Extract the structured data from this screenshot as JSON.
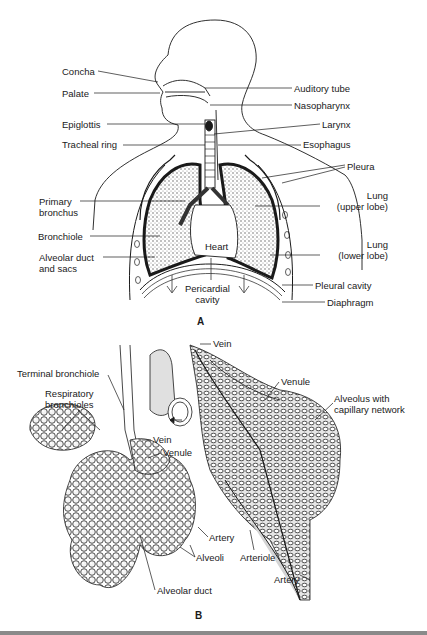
{
  "panel_a": {
    "letter": "A",
    "labels_left": [
      {
        "id": "concha",
        "text": "Concha",
        "x": 62,
        "y": 66
      },
      {
        "id": "palate",
        "text": "Palate",
        "x": 62,
        "y": 88
      },
      {
        "id": "epiglottis",
        "text": "Epiglottis",
        "x": 62,
        "y": 119
      },
      {
        "id": "tracheal-ring",
        "text": "Tracheal ring",
        "x": 62,
        "y": 139
      },
      {
        "id": "primary-bronchus",
        "text": "Primary\nbronchus",
        "x": 39,
        "y": 196
      },
      {
        "id": "bronchiole",
        "text": "Bronchiole",
        "x": 38,
        "y": 231
      },
      {
        "id": "alveolar-duct-and-sacs",
        "text": "Alveolar duct\nand sacs",
        "x": 39,
        "y": 252
      }
    ],
    "labels_right": [
      {
        "id": "auditory-tube",
        "text": "Auditory tube",
        "x": 294,
        "y": 83
      },
      {
        "id": "nasopharynx",
        "text": "Nasopharynx",
        "x": 294,
        "y": 100
      },
      {
        "id": "larynx",
        "text": "Larynx",
        "x": 322,
        "y": 119
      },
      {
        "id": "esophagus",
        "text": "Esophagus",
        "x": 303,
        "y": 139
      },
      {
        "id": "pleura",
        "text": "Pleura",
        "x": 347,
        "y": 161
      },
      {
        "id": "lung-upper-lobe",
        "text": "Lung\n(upper lobe)",
        "x": 322,
        "y": 190
      },
      {
        "id": "lung-lower-lobe",
        "text": "Lung\n(lower lobe)",
        "x": 323,
        "y": 239
      },
      {
        "id": "pleural-cavity",
        "text": "Pleural cavity",
        "x": 315,
        "y": 280
      },
      {
        "id": "diaphragm",
        "text": "Diaphragm",
        "x": 327,
        "y": 297
      }
    ],
    "labels_inner": [
      {
        "id": "heart",
        "text": "Heart",
        "x": 205,
        "y": 241
      },
      {
        "id": "pericardial-cavity",
        "text": "Pericardial\ncavity",
        "x": 185,
        "y": 283
      }
    ]
  },
  "panel_b": {
    "letter": "B",
    "labels": [
      {
        "id": "vein-top",
        "text": "Vein",
        "x": 213,
        "y": 338
      },
      {
        "id": "terminal-bronchiole",
        "text": "Terminal bronchiole",
        "x": 17,
        "y": 368
      },
      {
        "id": "respiratory-bronchioles",
        "text": "Respiratory\nbronchioles",
        "x": 45,
        "y": 388
      },
      {
        "id": "venule-right",
        "text": "Venule",
        "x": 281,
        "y": 376
      },
      {
        "id": "alveolus-with-capillary-network",
        "text": "Alveolus with\ncapillary network",
        "x": 334,
        "y": 393
      },
      {
        "id": "vein-mid",
        "text": "Vein",
        "x": 153,
        "y": 434
      },
      {
        "id": "venule-mid",
        "text": "Venule",
        "x": 163,
        "y": 447
      },
      {
        "id": "artery-mid",
        "text": "Artery",
        "x": 209,
        "y": 532
      },
      {
        "id": "alveoli",
        "text": "Alveoli",
        "x": 196,
        "y": 552
      },
      {
        "id": "arteriole",
        "text": "Arteriole",
        "x": 240,
        "y": 552
      },
      {
        "id": "artery-bottom",
        "text": "Artery",
        "x": 274,
        "y": 574
      },
      {
        "id": "alveolar-duct",
        "text": "Alveolar duct",
        "x": 157,
        "y": 585
      }
    ]
  },
  "colors": {
    "ink": "#1a1a1a",
    "stipple": "#b8b8b8",
    "vessel_fill": "#d4d4d4",
    "bottom_bar": "#8a8a8a",
    "background": "#ffffff"
  }
}
